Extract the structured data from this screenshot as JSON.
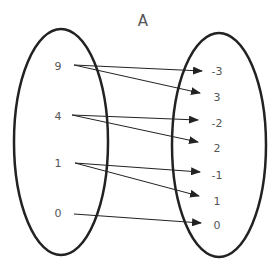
{
  "title": "A",
  "domain_set": [
    "9",
    "4",
    "1",
    "0"
  ],
  "codomain_set": [
    "-3",
    "3",
    "-2",
    "2",
    "-1",
    "1",
    "0"
  ],
  "mappings": [
    {
      "from": "9",
      "to": "-3"
    },
    {
      "from": "9",
      "to": "3"
    },
    {
      "from": "4",
      "to": "-2"
    },
    {
      "from": "4",
      "to": "2"
    },
    {
      "from": "1",
      "to": "-1"
    },
    {
      "from": "1",
      "to": "1"
    },
    {
      "from": "0",
      "to": "0"
    }
  ],
  "colors": {
    "stroke": "#222222",
    "text": "#555555",
    "background": "#ffffff"
  }
}
